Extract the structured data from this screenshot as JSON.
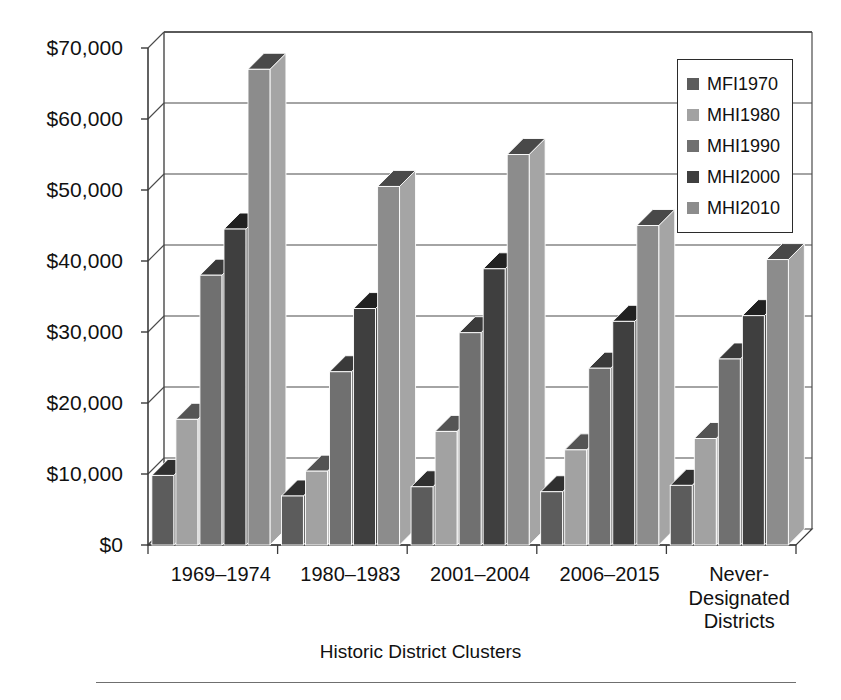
{
  "chart_data": {
    "type": "bar",
    "title": "",
    "subtitle": "",
    "xlabel": "Historic District Clusters",
    "ylabel": "",
    "ylim": [
      0,
      70000
    ],
    "ytick_step": 10000,
    "ytick_labels": [
      "$0",
      "$10,000",
      "$20,000",
      "$30,000",
      "$40,000",
      "$50,000",
      "$60,000",
      "$70,000"
    ],
    "ytick_values": [
      0,
      10000,
      20000,
      30000,
      40000,
      50000,
      60000,
      70000
    ],
    "grid": true,
    "legend_position": "top-right",
    "style": "3d-clustered-bar-grayscale",
    "categories": [
      "1969–1974",
      "1980–1983",
      "2001–2004",
      "2006–2015",
      "Never-\nDesignated\nDistricts"
    ],
    "series": [
      {
        "name": "MFI1970",
        "color": "#5c5c5c",
        "values": [
          9800,
          6900,
          8200,
          7500,
          8400
        ]
      },
      {
        "name": "MHI1980",
        "color": "#a2a2a2",
        "values": [
          17700,
          10400,
          16000,
          13400,
          15000
        ]
      },
      {
        "name": "MHI1990",
        "color": "#707070",
        "values": [
          38000,
          24400,
          29900,
          24900,
          26200
        ]
      },
      {
        "name": "MHI2000",
        "color": "#3f3f3f",
        "values": [
          44500,
          33300,
          38900,
          31500,
          32300
        ]
      },
      {
        "name": "MHI2010",
        "color": "#8c8c8c",
        "values": [
          67000,
          50500,
          55000,
          45000,
          40200
        ]
      }
    ]
  },
  "legend": {
    "items": [
      {
        "label": "MFI1970",
        "color": "#5c5c5c"
      },
      {
        "label": "MHI1980",
        "color": "#a2a2a2"
      },
      {
        "label": "MHI1990",
        "color": "#707070"
      },
      {
        "label": "MHI2000",
        "color": "#3f3f3f"
      },
      {
        "label": "MHI2010",
        "color": "#8c8c8c"
      }
    ]
  },
  "axes": {
    "x_title": "Historic District Clusters"
  },
  "colors": {
    "axis": "#3a3a3a",
    "grid": "#4a4a4a",
    "text": "#111111",
    "rule": "#6f6f6f",
    "background": "#ffffff"
  }
}
